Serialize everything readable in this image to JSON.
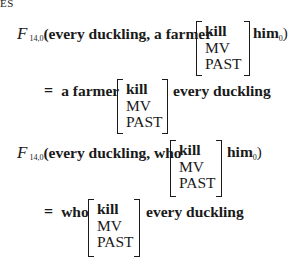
{
  "header": {
    "fragment": "ES"
  },
  "equations": [
    {
      "function": "F",
      "subscript": "14,0",
      "arg1": "(every duckling, a farmer",
      "matrix": [
        "kill",
        "MV",
        "PAST"
      ],
      "after": "him",
      "after_sub": "0",
      "close": ")"
    },
    {
      "equals": "=",
      "before": "a farmer",
      "matrix": [
        "kill",
        "MV",
        "PAST"
      ],
      "after": "every duckling"
    },
    {
      "function": "F",
      "subscript": "14,0",
      "arg1": "(every duckling, who",
      "matrix": [
        "kill",
        "MV",
        "PAST"
      ],
      "after": "him",
      "after_sub": "0",
      "close": ")"
    },
    {
      "equals": "=",
      "before": "who",
      "matrix": [
        "kill",
        "MV",
        "PAST"
      ],
      "after": "every duckling"
    }
  ]
}
